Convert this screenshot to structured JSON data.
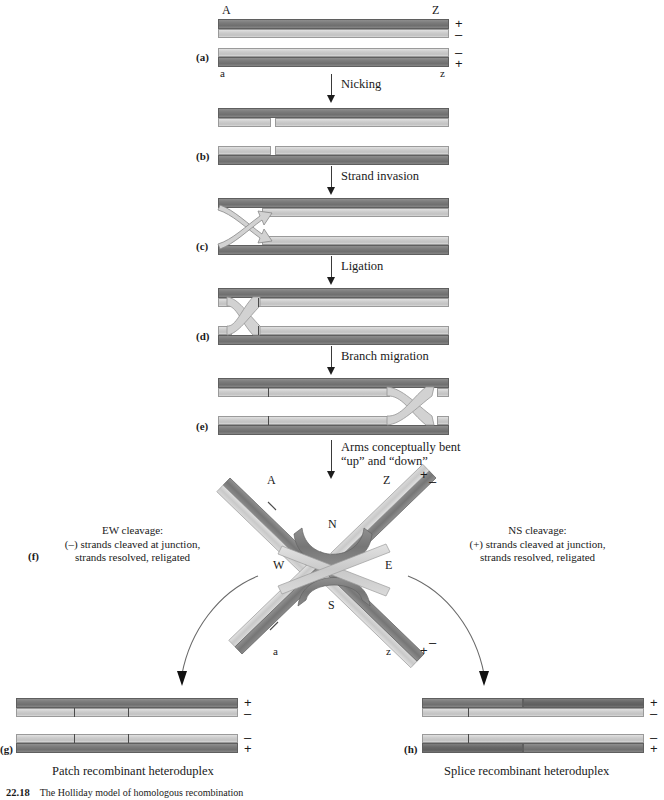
{
  "figure": {
    "number": "22.18",
    "caption": "The Holliday model of homologous recombination"
  },
  "panels": {
    "a": "(a)",
    "b": "(b)",
    "c": "(c)",
    "d": "(d)",
    "e": "(e)",
    "f": "(f)",
    "g": "(g)",
    "h": "(h)"
  },
  "end_labels": {
    "top_left": "A",
    "top_right": "Z",
    "bottom_left": "a",
    "bottom_right": "z"
  },
  "polarity": {
    "plus": "+",
    "minus": "–"
  },
  "steps": [
    {
      "id": "nicking",
      "label": "Nicking"
    },
    {
      "id": "strand-invasion",
      "label": "Strand invasion"
    },
    {
      "id": "ligation",
      "label": "Ligation"
    },
    {
      "id": "branch-migration",
      "label": "Branch migration"
    },
    {
      "id": "bending",
      "label_line1": "Arms conceptually bent",
      "label_line2": "“up” and “down”"
    }
  ],
  "junction": {
    "compass": {
      "north": "N",
      "south": "S",
      "east": "E",
      "west": "W"
    },
    "arm_labels": {
      "nw": "A",
      "ne": "Z",
      "sw": "a",
      "se": "z"
    }
  },
  "cleavage": {
    "ew": {
      "line1": "EW cleavage:",
      "line2": "(–) strands cleaved at junction,",
      "line3": "strands resolved, religated"
    },
    "ns": {
      "line1": "NS cleavage:",
      "line2": "(+) strands cleaved at junction,",
      "line3": "strands resolved, religated"
    }
  },
  "products": {
    "patch": "Patch recombinant heteroduplex",
    "splice": "Splice recombinant heteroduplex"
  },
  "colors": {
    "dark_strand": "#7b7b7b",
    "light_strand": "#cccccc",
    "text": "#1a1a1a",
    "arrow": "#3a3a3a"
  }
}
